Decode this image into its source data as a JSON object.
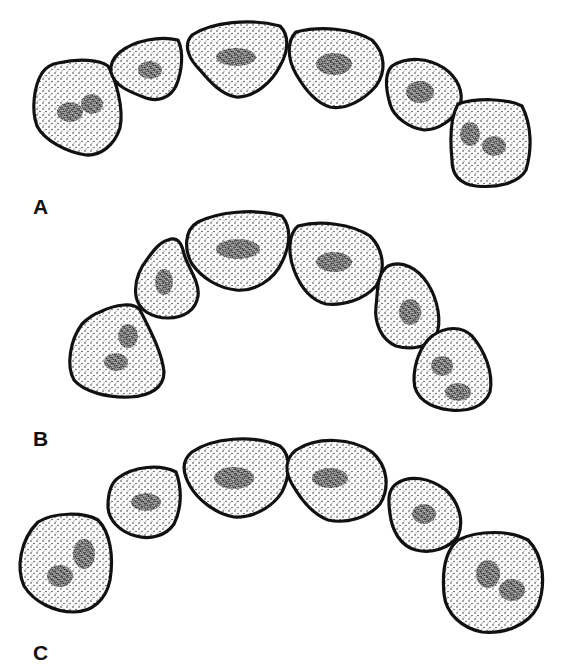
{
  "figure": {
    "colors": {
      "outline": "#111111",
      "stipple": "#222222",
      "background": "#ffffff"
    },
    "panels": [
      {
        "label": "A",
        "label_pos": [
          33,
          196
        ],
        "teeth": [
          {
            "name": "molar-left",
            "path": "M58,63 C80,58 100,60 108,66 C116,80 124,108 120,128 C114,146 100,156 86,155 C66,152 44,140 37,126 C31,110 34,86 42,73 C46,67 52,64 58,63 Z",
            "fissures": [
              [
                70,
                112,
                13,
                10
              ],
              [
                92,
                104,
                11,
                10
              ]
            ]
          },
          {
            "name": "premolar-left",
            "path": "M120,52 C135,40 160,36 178,40 C184,52 182,72 176,86 C170,98 158,102 146,98 C130,92 114,86 111,72 C110,64 114,57 120,52 Z",
            "fissures": [
              [
                150,
                70,
                12,
                9
              ]
            ]
          },
          {
            "name": "incisor-left",
            "path": "M192,35 C212,22 250,18 280,26 C290,36 288,52 280,66 C272,82 254,98 236,97 C222,95 210,82 200,70 C190,60 182,46 192,35 Z",
            "fissures": [
              [
                236,
                57,
                20,
                9
              ]
            ]
          },
          {
            "name": "incisor-right",
            "path": "M296,32 C320,26 352,28 372,40 C386,54 386,72 376,86 C364,100 346,110 330,107 C316,103 304,88 296,74 C288,60 286,42 296,32 Z",
            "fissures": [
              [
                334,
                64,
                18,
                11
              ]
            ]
          },
          {
            "name": "premolar-right",
            "path": "M392,66 C408,56 428,58 444,68 C458,78 464,92 460,106 C454,120 438,130 424,130 C410,128 394,118 390,104 C386,90 384,74 392,66 Z",
            "fissures": [
              [
                420,
                92,
                14,
                11
              ]
            ]
          },
          {
            "name": "molar-right",
            "path": "M458,104 C476,98 506,98 522,106 C532,126 532,150 526,170 C518,184 496,188 476,186 C460,184 452,176 452,160 C450,140 450,118 458,104 Z",
            "fissures": [
              [
                470,
                134,
                10,
                12
              ],
              [
                494,
                146,
                12,
                10
              ]
            ]
          }
        ]
      },
      {
        "label": "B",
        "label_pos": [
          33,
          428
        ],
        "teeth": [
          {
            "name": "molar-left",
            "path": "M100,312 C116,304 134,302 140,310 C150,330 162,352 164,372 C164,388 150,396 130,397 C108,398 84,392 74,380 C66,366 70,340 82,324 C88,318 94,314 100,312 Z",
            "fissures": [
              [
                128,
                336,
                10,
                12
              ],
              [
                116,
                362,
                12,
                9
              ]
            ]
          },
          {
            "name": "premolar-left",
            "path": "M168,240 C178,236 182,244 184,254 C188,268 200,282 198,296 C196,310 184,318 168,318 C152,318 138,310 136,296 C134,282 140,268 148,258 C154,250 160,242 168,240 Z",
            "fissures": [
              [
                164,
                282,
                9,
                13
              ]
            ]
          },
          {
            "name": "incisor-left",
            "path": "M198,222 C218,212 254,208 282,216 C292,228 290,246 282,262 C274,280 254,292 236,290 C218,288 202,278 192,264 C184,250 184,230 198,222 Z",
            "fissures": [
              [
                238,
                249,
                22,
                10
              ]
            ]
          },
          {
            "name": "incisor-right",
            "path": "M298,226 C320,220 352,224 370,236 C384,250 386,270 376,286 C364,300 342,306 326,304 C310,300 300,286 294,270 C288,254 288,234 298,226 Z",
            "fissures": [
              [
                334,
                262,
                18,
                10
              ]
            ]
          },
          {
            "name": "premolar-right",
            "path": "M388,266 C402,260 418,268 428,284 C438,300 442,322 436,336 C428,348 410,350 396,346 C382,340 374,324 376,306 C378,292 376,274 388,266 Z",
            "fissures": [
              [
                410,
                312,
                11,
                13
              ]
            ]
          },
          {
            "name": "molar-right",
            "path": "M432,336 C446,326 462,326 472,336 C484,350 494,372 490,392 C484,408 466,412 450,410 C430,408 414,398 414,380 C414,364 420,346 432,336 Z",
            "fissures": [
              [
                442,
                366,
                11,
                10
              ],
              [
                458,
                392,
                13,
                9
              ]
            ]
          }
        ]
      },
      {
        "label": "C",
        "label_pos": [
          33,
          642
        ],
        "teeth": [
          {
            "name": "molar-left",
            "path": "M38,522 C54,512 84,512 98,520 C110,532 114,556 110,580 C106,600 92,612 74,612 C54,612 34,602 24,586 C16,568 20,540 38,522 Z",
            "fissures": [
              [
                84,
                554,
                11,
                15
              ],
              [
                60,
                576,
                13,
                11
              ]
            ]
          },
          {
            "name": "premolar-left",
            "path": "M118,478 C134,466 160,464 176,472 C182,488 182,508 174,524 C166,536 150,540 136,536 C120,532 108,520 108,506 C108,494 110,484 118,478 Z",
            "fissures": [
              [
                146,
                502,
                15,
                9
              ]
            ]
          },
          {
            "name": "incisor-left",
            "path": "M192,452 C212,438 252,434 280,446 C292,456 290,476 282,492 C272,508 252,518 234,517 C216,514 198,500 190,486 C182,472 182,460 192,452 Z",
            "fissures": [
              [
                234,
                478,
                20,
                11
              ]
            ]
          },
          {
            "name": "incisor-right",
            "path": "M296,450 C318,436 352,438 372,452 C388,466 390,488 380,504 C368,518 346,524 328,520 C312,514 300,498 292,484 C284,470 286,458 296,450 Z",
            "fissures": [
              [
                330,
                478,
                18,
                10
              ]
            ]
          },
          {
            "name": "premolar-right",
            "path": "M396,484 C410,474 430,478 446,490 C460,504 464,522 458,536 C450,548 432,554 416,550 C400,546 392,530 390,514 C388,500 388,490 396,484 Z",
            "fissures": [
              [
                424,
                514,
                12,
                10
              ]
            ]
          },
          {
            "name": "molar-right",
            "path": "M458,540 C478,530 510,530 528,540 C544,556 546,584 538,606 C528,626 504,634 482,632 C462,628 446,614 444,594 C442,572 444,552 458,540 Z",
            "fissures": [
              [
                488,
                574,
                12,
                14
              ],
              [
                512,
                590,
                13,
                11
              ]
            ]
          }
        ]
      }
    ]
  }
}
